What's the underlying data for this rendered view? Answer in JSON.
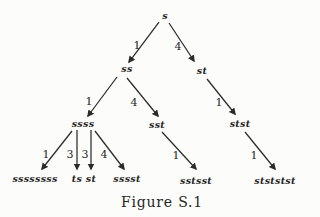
{
  "figure": {
    "caption": "Figure S.1",
    "background_color": "#fcfcfa",
    "ink_color": "#2b2b28"
  },
  "tree": {
    "nodes": [
      {
        "id": "s",
        "label": "s"
      },
      {
        "id": "ss",
        "label": "ss"
      },
      {
        "id": "st",
        "label": "st"
      },
      {
        "id": "ssss",
        "label": "ssss"
      },
      {
        "id": "sst",
        "label": "sst"
      },
      {
        "id": "stst",
        "label": "stst"
      },
      {
        "id": "ssssssss",
        "label": "ssssssss"
      },
      {
        "id": "ts",
        "label": "ts"
      },
      {
        "id": "st-leaf",
        "label": "st"
      },
      {
        "id": "sssst",
        "label": "sssst"
      },
      {
        "id": "sstsst",
        "label": "sstsst"
      },
      {
        "id": "stststst",
        "label": "stststst"
      }
    ],
    "edges": [
      {
        "from": "s",
        "to": "ss",
        "label": "1"
      },
      {
        "from": "s",
        "to": "st",
        "label": "4"
      },
      {
        "from": "ss",
        "to": "ssss",
        "label": "1"
      },
      {
        "from": "ss",
        "to": "sst",
        "label": "4"
      },
      {
        "from": "st",
        "to": "stst",
        "label": "1"
      },
      {
        "from": "ssss",
        "to": "ssssssss",
        "label": "1"
      },
      {
        "from": "ssss",
        "to": "ts",
        "label": "3"
      },
      {
        "from": "ssss",
        "to": "st-leaf",
        "label": "3"
      },
      {
        "from": "ssss",
        "to": "sssst",
        "label": "4"
      },
      {
        "from": "sst",
        "to": "sstsst",
        "label": "1"
      },
      {
        "from": "stst",
        "to": "stststst",
        "label": "1"
      }
    ]
  }
}
